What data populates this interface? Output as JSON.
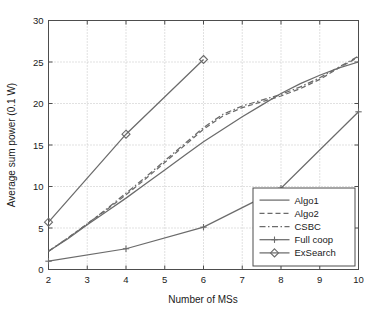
{
  "chart_data": {
    "type": "line",
    "title": "",
    "xlabel": "Number of MSs",
    "ylabel": "Average sum power (0.1 W)",
    "xlim": [
      2,
      10
    ],
    "ylim": [
      0,
      30
    ],
    "xticks": [
      "2",
      "3",
      "4",
      "5",
      "6",
      "7",
      "8",
      "9",
      "10"
    ],
    "yticks": [
      "0",
      "5",
      "10",
      "15",
      "20",
      "25",
      "30"
    ],
    "grid": true,
    "legend_position": "lower right",
    "line_color": "#6b6b6b",
    "axis_color": "#4d4d4d",
    "grid_color": "#b4b4b4",
    "series": [
      {
        "name": "Algo1",
        "style": "solid",
        "marker": "none",
        "x": [
          2,
          2.5,
          3,
          3.5,
          4,
          4.5,
          5,
          5.5,
          6,
          6.5,
          7,
          7.5,
          8,
          8.5,
          9,
          9.5,
          10
        ],
        "values": [
          2.2,
          3.7,
          5.4,
          7.0,
          8.6,
          10.3,
          12.0,
          13.7,
          15.4,
          16.9,
          18.4,
          19.8,
          21.2,
          22.4,
          23.4,
          24.3,
          25.0
        ]
      },
      {
        "name": "Algo2",
        "style": "dashed",
        "marker": "none",
        "x": [
          2,
          2.5,
          3,
          3.5,
          4,
          4.5,
          5,
          5.5,
          6,
          6.5,
          7,
          7.5,
          8,
          8.5,
          9,
          9.5,
          10
        ],
        "values": [
          2.2,
          3.8,
          5.5,
          7.2,
          9.0,
          10.9,
          12.9,
          14.9,
          16.9,
          18.5,
          19.5,
          20.2,
          20.9,
          21.8,
          22.9,
          24.3,
          25.6
        ]
      },
      {
        "name": "CSBC",
        "style": "dashdot",
        "marker": "none",
        "x": [
          2,
          2.5,
          3,
          3.5,
          4,
          4.5,
          5,
          5.5,
          6,
          6.5,
          7,
          7.5,
          8,
          8.5,
          9,
          9.5,
          10
        ],
        "values": [
          2.2,
          3.8,
          5.5,
          7.3,
          9.2,
          11.1,
          13.1,
          15.1,
          17.1,
          18.7,
          19.7,
          20.4,
          21.1,
          22.0,
          23.1,
          24.4,
          25.7
        ]
      },
      {
        "name": "Full coop",
        "style": "solid",
        "marker": "plus",
        "x": [
          2,
          4,
          6,
          8,
          10
        ],
        "values": [
          1.0,
          2.5,
          5.1,
          9.8,
          19.0
        ]
      },
      {
        "name": "ExSearch",
        "style": "solid",
        "marker": "diamond",
        "x": [
          2,
          4,
          6
        ],
        "values": [
          5.7,
          16.3,
          25.3
        ]
      }
    ]
  },
  "legend": {
    "items": [
      {
        "label": "Algo1"
      },
      {
        "label": "Algo2"
      },
      {
        "label": "CSBC"
      },
      {
        "label": "Full coop"
      },
      {
        "label": "ExSearch"
      }
    ]
  }
}
